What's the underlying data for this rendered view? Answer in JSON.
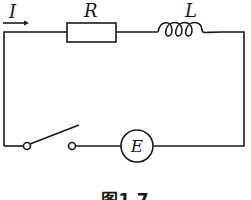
{
  "diagram": {
    "type": "circuit",
    "labels": {
      "current": "I",
      "resistor": "R",
      "inductor": "L",
      "source": "E"
    },
    "caption": "图1.7",
    "components": [
      {
        "kind": "resistor",
        "label": "R"
      },
      {
        "kind": "inductor",
        "label": "L"
      },
      {
        "kind": "switch",
        "state": "open"
      },
      {
        "kind": "source",
        "label": "E"
      }
    ]
  }
}
